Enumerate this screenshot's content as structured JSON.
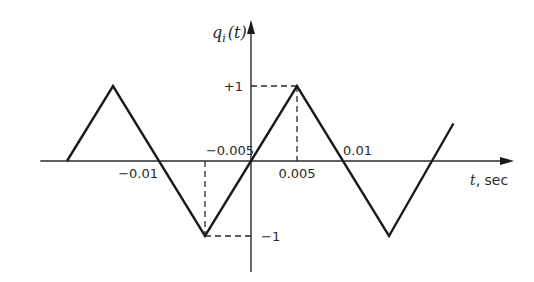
{
  "chart_data": {
    "type": "line",
    "title": "",
    "xlabel": "t, sec",
    "ylabel": "q_i(t)",
    "ylabel_parts": {
      "main": "q",
      "sub": "i",
      "arg": "(t)"
    },
    "xlabel_parts": {
      "var": "t",
      "unit": ", sec"
    },
    "x_ticks": [
      {
        "value": -0.01,
        "label": "-0.01",
        "side": "below"
      },
      {
        "value": -0.005,
        "label": "-0.005",
        "side": "above"
      },
      {
        "value": 0.005,
        "label": "0.005",
        "side": "below"
      },
      {
        "value": 0.01,
        "label": "0.01",
        "side": "above"
      }
    ],
    "y_ticks": [
      {
        "value": 1,
        "label": "+1",
        "side": "left"
      },
      {
        "value": -1,
        "label": "-1",
        "side": "right"
      }
    ],
    "xlim": [
      -0.0229,
      0.0283
    ],
    "ylim": [
      -1.5,
      1.85
    ],
    "grid": false,
    "legend": null,
    "series": [
      {
        "name": "triangular wave q_i(t)",
        "x": [
          -0.02,
          -0.015,
          -0.005,
          0.005,
          0.015,
          0.022
        ],
        "y": [
          0,
          1,
          -1,
          1,
          -1,
          0.5
        ]
      }
    ],
    "reference_lines": [
      {
        "type": "dashed",
        "from": [
          0,
          1
        ],
        "to": [
          0.005,
          1
        ]
      },
      {
        "type": "dashed",
        "from": [
          0.005,
          1
        ],
        "to": [
          0.005,
          0
        ]
      },
      {
        "type": "dashed",
        "from": [
          -0.005,
          0
        ],
        "to": [
          -0.005,
          -1
        ]
      },
      {
        "type": "dashed",
        "from": [
          -0.005,
          -1
        ],
        "to": [
          0,
          -1
        ]
      }
    ]
  }
}
